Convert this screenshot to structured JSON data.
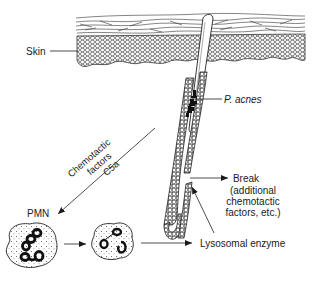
{
  "diagram": {
    "type": "biological-schematic",
    "labels": {
      "skin": "Skin",
      "p_acnes": "P. acnes",
      "chemotactic_line1": "Chemotactic",
      "chemotactic_line2": "factors",
      "chemotactic_line3": "C5a",
      "pmn": "PMN",
      "break_line1": "Break",
      "break_line2": "(additional",
      "break_line3": "chemotactic",
      "break_line4": "factors, etc.)",
      "lysosomal": "Lysosomal enzyme"
    },
    "nodes": [
      {
        "id": "skin",
        "label": "Skin",
        "shape": "layered tissue band"
      },
      {
        "id": "follicle",
        "label": "Hair follicle",
        "shape": "elongated tube"
      },
      {
        "id": "p_acnes",
        "label": "P. acnes",
        "shape": "bacterial cluster inside follicle"
      },
      {
        "id": "break",
        "label": "Break (additional chemotactic factors, etc.)",
        "shape": "rupture in follicle wall"
      },
      {
        "id": "pmn",
        "label": "PMN",
        "shape": "cell with multilobed nucleus"
      },
      {
        "id": "pmn2",
        "label": "",
        "shape": "activated cell"
      },
      {
        "id": "lysosomal",
        "label": "Lysosomal enzyme",
        "shape": "text"
      }
    ],
    "edges": [
      {
        "from": "skin",
        "to": "skin_band",
        "label": ""
      },
      {
        "from": "p_acnes",
        "to": "p_acnes_label",
        "label": ""
      },
      {
        "from": "follicle",
        "to": "pmn",
        "label": "Chemotactic factors C5a"
      },
      {
        "from": "break",
        "to": "break_label",
        "label": ""
      },
      {
        "from": "pmn",
        "to": "pmn2",
        "label": ""
      },
      {
        "from": "pmn2",
        "to": "lysosomal",
        "label": ""
      },
      {
        "from": "lysosomal",
        "to": "break",
        "label": ""
      }
    ],
    "colors": {
      "ink": "#1a1a1a",
      "background": "#ffffff"
    }
  }
}
